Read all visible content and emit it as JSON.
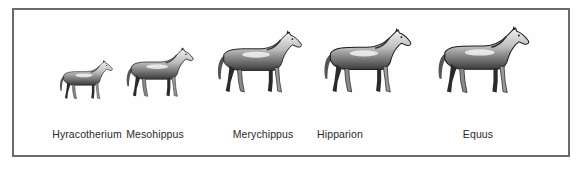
{
  "figure": {
    "title": "",
    "frame_color": "#6a6a6a",
    "horses": [
      {
        "name": "Hyracotherium",
        "label_x": 87,
        "x": 56,
        "y": 60,
        "scale": 0.62
      },
      {
        "name": "Mesohippus",
        "label_x": 155,
        "x": 122,
        "y": 47,
        "scale": 0.78
      },
      {
        "name": "Merychippus",
        "label_x": 263,
        "x": 212,
        "y": 30,
        "scale": 0.98
      },
      {
        "name": "Hipparion",
        "label_x": 340,
        "x": 318,
        "y": 28,
        "scale": 1.02
      },
      {
        "name": "Equus",
        "label_x": 478,
        "x": 432,
        "y": 26,
        "scale": 1.06
      }
    ]
  }
}
